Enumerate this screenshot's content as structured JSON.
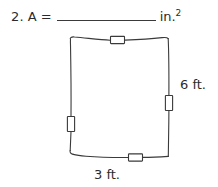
{
  "problem": {
    "number": "2.",
    "variable": "A",
    "equals": "=",
    "answer_value": "",
    "answer_placeholder": "",
    "unit": "in.",
    "unit_exponent": "2"
  },
  "figure": {
    "shape_name": "rectangle",
    "style": "hand-drawn",
    "stroke_color": "#3a3a3a",
    "fill_color": "#ffffff",
    "tick_marks": [
      {
        "side": "top",
        "name": "tick-mark-top"
      },
      {
        "side": "right",
        "name": "tick-mark-right"
      },
      {
        "side": "bottom",
        "name": "tick-mark-bottom"
      },
      {
        "side": "left",
        "name": "tick-mark-left"
      }
    ],
    "labels": {
      "right": "6 ft.",
      "bottom": "3 ft."
    }
  }
}
